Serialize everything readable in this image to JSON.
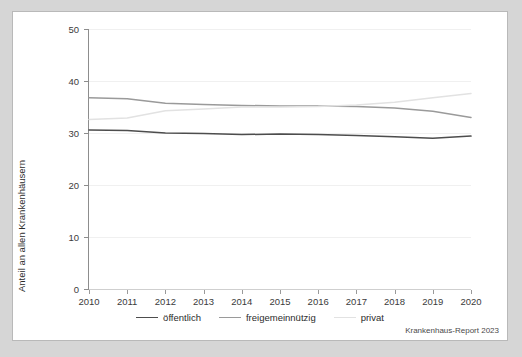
{
  "figure": {
    "source_note": "Krankenhaus-Report 2023"
  },
  "chart_data": {
    "type": "line",
    "title": "",
    "subtitle": "",
    "xlabel": "",
    "ylabel": "Anteil an allen Krankenhäusern",
    "x": [
      2010,
      2011,
      2012,
      2013,
      2014,
      2015,
      2016,
      2017,
      2018,
      2019,
      2020
    ],
    "categories": [
      "2010",
      "2011",
      "2012",
      "2013",
      "2014",
      "2015",
      "2016",
      "2017",
      "2018",
      "2019",
      "2020"
    ],
    "xlim": [
      2010,
      2020
    ],
    "ylim": [
      0,
      50
    ],
    "yticks": [
      0,
      10,
      20,
      30,
      40,
      50
    ],
    "ytick_labels": [
      "0",
      "10",
      "20",
      "30",
      "40",
      "50"
    ],
    "grid": "horizontal",
    "legend_position": "bottom-center",
    "series": [
      {
        "name": "öffentlich",
        "color": "#4d4d4d",
        "values": [
          30.6,
          30.5,
          30.0,
          29.9,
          29.7,
          29.8,
          29.7,
          29.5,
          29.3,
          29.0,
          29.4
        ]
      },
      {
        "name": "freigemeinnützig",
        "color": "#9a9a9a",
        "values": [
          36.8,
          36.6,
          35.7,
          35.5,
          35.3,
          35.2,
          35.2,
          35.1,
          34.8,
          34.2,
          33.0
        ]
      },
      {
        "name": "privat",
        "color": "#e2e2e2",
        "values": [
          32.6,
          32.9,
          34.3,
          34.6,
          35.0,
          35.0,
          35.1,
          35.4,
          35.9,
          36.8,
          37.6
        ]
      }
    ]
  }
}
